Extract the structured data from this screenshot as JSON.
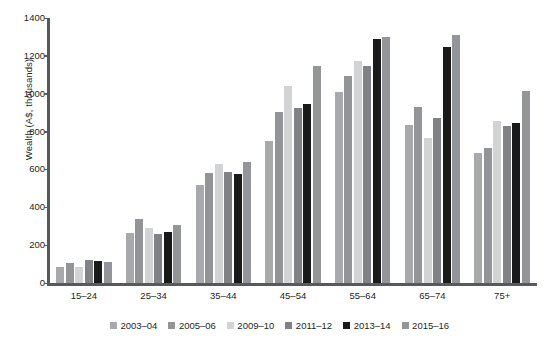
{
  "chart_data": {
    "type": "bar",
    "title": "",
    "subtitle": "",
    "xlabel": "",
    "ylabel": "Wealth (A$, thousands)",
    "ylim": [
      0,
      1400
    ],
    "yticks": [
      0,
      200,
      400,
      600,
      800,
      1000,
      1200,
      1400
    ],
    "ytick_labels": [
      "0",
      "200",
      "400",
      "600",
      "800",
      "1000",
      "1200",
      "1400"
    ],
    "grid": false,
    "legend_position": "bottom",
    "categories": [
      "15–24",
      "25–34",
      "35–44",
      "45–54",
      "55–64",
      "65–74",
      "75+"
    ],
    "series": [
      {
        "name": "2003–04",
        "color": "#a7a9ac",
        "values": [
          84,
          266,
          519,
          752,
          1009,
          836,
          688
        ]
      },
      {
        "name": "2005–06",
        "color": "#929497",
        "values": [
          106,
          338,
          581,
          903,
          1092,
          928,
          711
        ]
      },
      {
        "name": "2009–10",
        "color": "#d1d3d4",
        "values": [
          85,
          292,
          630,
          1043,
          1175,
          768,
          855
        ]
      },
      {
        "name": "2011–12",
        "color": "#808285",
        "values": [
          120,
          258,
          585,
          924,
          1146,
          871,
          827
        ]
      },
      {
        "name": "2013–14",
        "color": "#1a1a1a",
        "values": [
          115,
          268,
          578,
          947,
          1290,
          1248,
          844
        ]
      },
      {
        "name": "2015–16",
        "color": "#939598",
        "values": [
          112,
          309,
          640,
          1147,
          1302,
          1312,
          1013
        ]
      }
    ]
  }
}
